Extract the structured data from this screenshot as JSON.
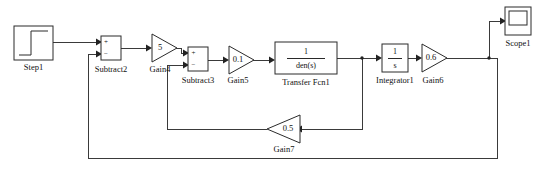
{
  "diagram": {
    "kind": "simulink-block-diagram",
    "canvas": {
      "width": 543,
      "height": 169,
      "background": "#ffffff"
    },
    "line_color": "#3a3a3a",
    "block_stroke": "#2b2b2b",
    "blocks": {
      "step": {
        "label": "Step1",
        "icon": "step-signal-icon"
      },
      "subtract2": {
        "label": "Subtract2",
        "sign_top": "+",
        "sign_bottom": "−"
      },
      "gain4": {
        "label": "Gain4",
        "value": "5"
      },
      "subtract3": {
        "label": "Subtract3",
        "sign_top": "+",
        "sign_bottom": "−"
      },
      "gain5": {
        "label": "Gain5",
        "value": "0.1"
      },
      "transfer_fcn1": {
        "label": "Transfer Fcn1",
        "numerator": "1",
        "denominator": "den(s)"
      },
      "integrator1": {
        "label": "Integrator1",
        "numerator": "1",
        "denominator": "s"
      },
      "gain6": {
        "label": "Gain6",
        "value": "0.6"
      },
      "gain7": {
        "label": "Gain7",
        "value": "0.5",
        "direction": "right-to-left"
      },
      "scope1": {
        "label": "Scope1",
        "icon": "scope-display-icon"
      }
    }
  }
}
